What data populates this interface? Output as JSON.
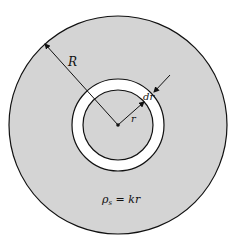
{
  "diagram": {
    "labels": {
      "outer_radius": "R",
      "inner_radius": "r",
      "ring_width": "dr",
      "density_symbol": "ρ",
      "density_subscript": "s",
      "density_rhs": " = kr"
    },
    "colors": {
      "disk_fill": "#d4d4d4",
      "ring_fill": "#ffffff",
      "stroke": "#111111"
    }
  }
}
